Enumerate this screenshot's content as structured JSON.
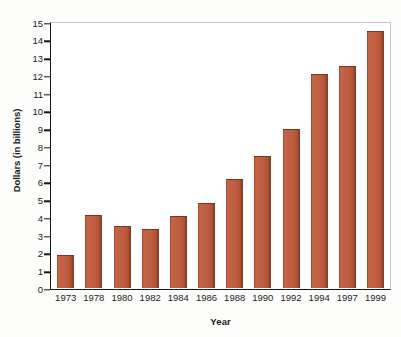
{
  "chart_data": {
    "type": "bar",
    "title": "",
    "xlabel": "Year",
    "ylabel": "Dollars (in billions)",
    "categories": [
      "1973",
      "1978",
      "1980",
      "1982",
      "1984",
      "1986",
      "1988",
      "1990",
      "1992",
      "1994",
      "1997",
      "1999"
    ],
    "values": [
      1.9,
      4.15,
      3.5,
      3.35,
      4.05,
      4.8,
      6.15,
      7.45,
      9.0,
      12.1,
      12.5,
      14.5
    ],
    "ylim": [
      0,
      15
    ],
    "y_ticks": [
      0,
      1,
      2,
      3,
      4,
      5,
      6,
      7,
      8,
      9,
      10,
      11,
      12,
      13,
      14,
      15
    ],
    "y_tick_labels": [
      "0",
      "1",
      "2",
      "3",
      "4",
      "5",
      "6",
      "7",
      "8",
      "9",
      "10",
      "11",
      "12",
      "13",
      "14",
      "15"
    ],
    "grid": false,
    "legend": null,
    "bar_color": "#c1603f",
    "bar_edge_color": "#7a3621",
    "axis_color": "#161616",
    "frame_color": "#c8c8c8",
    "background": "#ffffff"
  }
}
